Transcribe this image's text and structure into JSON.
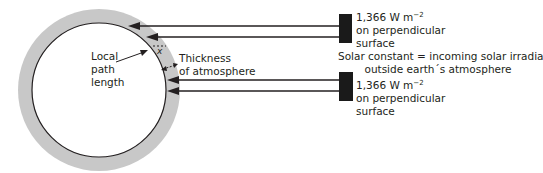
{
  "diagram": {
    "labels": {
      "local_path": [
        "Local",
        "path",
        "length"
      ],
      "thickness": [
        "Thickness",
        "of atmosphere"
      ],
      "x_marker": "x",
      "irradiance_top": {
        "value": "1,366 W m",
        "exponent": "−2",
        "line2": "on perpendicular",
        "line3": "surface"
      },
      "irradiance_bottom": {
        "value": "1,366 W m",
        "exponent": "−2",
        "line2": "on perpendicular",
        "line3": "surface"
      },
      "solar_constant": [
        "Solar constant = incoming solar irradiance",
        "outside earth´s atmosphere"
      ]
    },
    "colors": {
      "atmosphere": "#c8c8c8",
      "earth": "#ffffff",
      "lines": "#231f20",
      "sun_block": "#1a1a1a"
    }
  }
}
